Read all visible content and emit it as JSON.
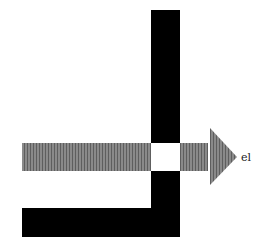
{
  "diagram": {
    "arrow_label": "el",
    "colors": {
      "wall": "#000000",
      "beam": "#7a7a7a",
      "beam_stripe": "#5a5a5a",
      "background": "#ffffff"
    }
  }
}
